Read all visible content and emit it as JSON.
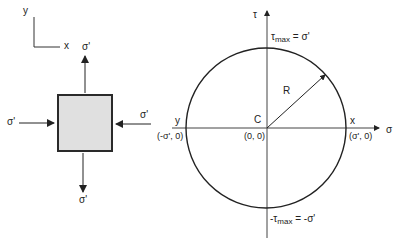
{
  "element": {
    "axes": {
      "x_label": "x",
      "y_label": "y"
    },
    "stress_labels": {
      "top": "σ'",
      "bottom": "σ'",
      "left": "σ'",
      "right": "σ'"
    },
    "fill_color": "#e0e0e0",
    "stroke_color": "#2a2a2a"
  },
  "mohr_circle": {
    "sigma_axis_label": "σ",
    "tau_axis_label": "τ",
    "tau_max_top": {
      "prefix": "τ",
      "sub": "max",
      "suffix": " = σ'"
    },
    "tau_max_bottom": {
      "prefix": "-τ",
      "sub": "max",
      "suffix": " = -σ'"
    },
    "center_label": "C",
    "center_coord": "(0, 0)",
    "radius_label": "R",
    "point_x": {
      "label": "x",
      "coord": "(σ', 0)"
    },
    "point_y": {
      "label": "y",
      "coord": "(-σ', 0)"
    }
  }
}
